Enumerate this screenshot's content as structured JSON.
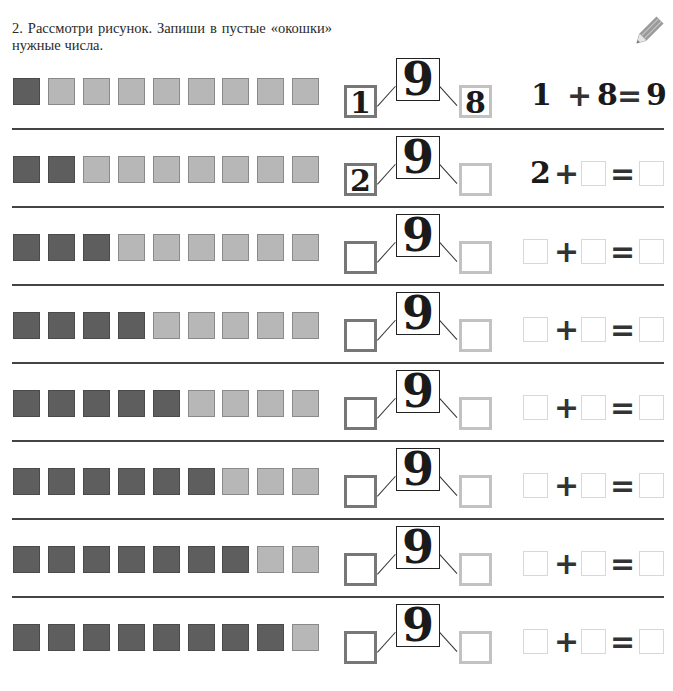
{
  "task": {
    "number": "2.",
    "text": "2. Рассмотри рисунок. Запиши в пустые «окошки» нужные числа."
  },
  "icons": {
    "pencil": "pencil-icon"
  },
  "colors": {
    "filled_square": "#5e5e5e",
    "empty_square": "#b7b7b7",
    "left_box_border": "#777777",
    "right_box_border": "#c2c2c2"
  },
  "total": "9",
  "plus": "+",
  "equals": "=",
  "rows": [
    {
      "dark": 1,
      "light": 8,
      "left": "1",
      "right": "8",
      "eq": {
        "a": "1",
        "b": "8",
        "c": "9",
        "filled": true
      }
    },
    {
      "dark": 2,
      "light": 7,
      "left": "2",
      "right": "",
      "eq": {
        "a": "2",
        "b": "",
        "c": "",
        "filled": false,
        "a_given": true
      }
    },
    {
      "dark": 3,
      "light": 6,
      "left": "",
      "right": "",
      "eq": {
        "a": "",
        "b": "",
        "c": "",
        "filled": false
      }
    },
    {
      "dark": 4,
      "light": 5,
      "left": "",
      "right": "",
      "eq": {
        "a": "",
        "b": "",
        "c": "",
        "filled": false
      }
    },
    {
      "dark": 5,
      "light": 4,
      "left": "",
      "right": "",
      "eq": {
        "a": "",
        "b": "",
        "c": "",
        "filled": false
      }
    },
    {
      "dark": 6,
      "light": 3,
      "left": "",
      "right": "",
      "eq": {
        "a": "",
        "b": "",
        "c": "",
        "filled": false
      }
    },
    {
      "dark": 7,
      "light": 2,
      "left": "",
      "right": "",
      "eq": {
        "a": "",
        "b": "",
        "c": "",
        "filled": false
      }
    },
    {
      "dark": 8,
      "light": 1,
      "left": "",
      "right": "",
      "eq": {
        "a": "",
        "b": "",
        "c": "",
        "filled": false
      }
    }
  ]
}
